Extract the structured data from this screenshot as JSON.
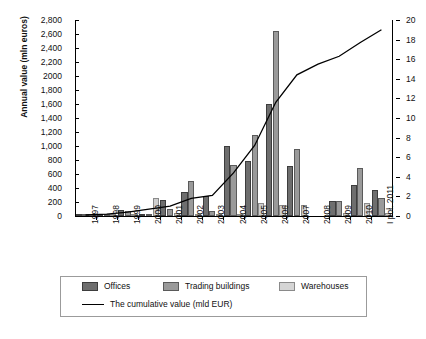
{
  "chart_data": {
    "type": "bar",
    "title": "",
    "xlabel": "",
    "ylabel": "Annual value (mln euros)",
    "ylabel_right": "",
    "ylim": [
      0,
      2800
    ],
    "ylim_right": [
      0,
      20
    ],
    "grid": false,
    "legend_position": "bottom",
    "categories": [
      "1997",
      "1998",
      "1999",
      "2000",
      "2001",
      "2002",
      "2003",
      "2004",
      "2005",
      "2006",
      "2007",
      "2008",
      "2009",
      "2010",
      "I poł. 2011"
    ],
    "series": [
      {
        "name": "Offices",
        "color": "#6e6e6e",
        "values": [
          15,
          30,
          90,
          10,
          230,
          350,
          290,
          1000,
          780,
          1600,
          720,
          0,
          210,
          450,
          370
        ]
      },
      {
        "name": "Trading buildings",
        "color": "#9a9a9a",
        "values": [
          20,
          35,
          65,
          20,
          100,
          500,
          70,
          730,
          1160,
          2650,
          960,
          0,
          215,
          680,
          260
        ]
      },
      {
        "name": "Warehouses",
        "color": "#cfcfcf",
        "values": [
          5,
          10,
          15,
          255,
          50,
          20,
          15,
          30,
          185,
          155,
          160,
          0,
          40,
          180,
          50
        ]
      }
    ],
    "line_series": {
      "name": "The cumulative value (mld EUR)",
      "color": "#000000",
      "axis": "right",
      "values": [
        0.1,
        0.2,
        0.4,
        0.7,
        1.0,
        1.8,
        2.1,
        4.4,
        7.2,
        11.6,
        14.4,
        15.5,
        16.3,
        17.7,
        19.0
      ]
    },
    "y_ticks_left": [
      "0",
      "200",
      "400",
      "600",
      "800",
      "1,000",
      "1,200",
      "1,400",
      "1,600",
      "1,800",
      "2000",
      "2,200",
      "2,400",
      "2,600",
      "2,800"
    ],
    "y_ticks_right": [
      "0",
      "2",
      "4",
      "6",
      "8",
      "10",
      "12",
      "14",
      "16",
      "18",
      "20"
    ],
    "legend": [
      {
        "key": "offices",
        "label": "Offices",
        "marker": "swatch-dark"
      },
      {
        "key": "trading",
        "label": "Trading buildings",
        "marker": "swatch-medium"
      },
      {
        "key": "warehouses",
        "label": "Warehouses",
        "marker": "swatch-light"
      },
      {
        "key": "cumulative",
        "label": "The cumulative value (mld EUR)",
        "marker": "line"
      }
    ]
  }
}
